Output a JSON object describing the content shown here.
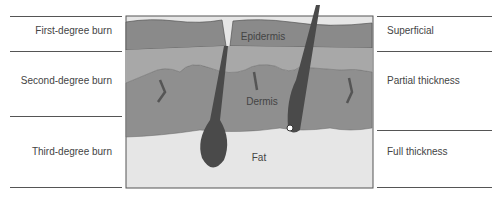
{
  "left_labels": [
    "First-degree burn",
    "Second-degree burn",
    "Third-degree burn"
  ],
  "right_labels": [
    "Superficial",
    "Partial thickness",
    "Full thickness"
  ],
  "layers": {
    "epidermis": "Epidermis",
    "dermis": "Dermis",
    "fat": "Fat"
  },
  "colors": {
    "epidermis": "#8a8a8a",
    "upper_dermis": "#a8a8a8",
    "dermis": "#8f8f8f",
    "fat": "#e6e6e6",
    "hair": "#4a4a4a"
  }
}
